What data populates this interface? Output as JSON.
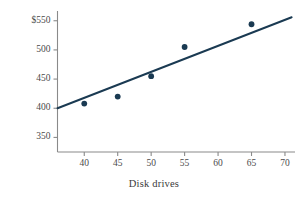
{
  "chart_data": {
    "type": "scatter",
    "title": "",
    "subtitle": "",
    "xlabel": "Disk drives",
    "ylabel": "Costs",
    "xlim": [
      36,
      71.5
    ],
    "ylim": [
      325,
      565
    ],
    "grid": false,
    "legend": null,
    "x_ticks": [
      40,
      45,
      50,
      55,
      60,
      65,
      70
    ],
    "x_tick_labels": [
      "40",
      "45",
      "50",
      "55",
      "60",
      "65",
      "70"
    ],
    "y_ticks": [
      350,
      400,
      450,
      500,
      550
    ],
    "y_tick_labels": [
      "350",
      "400",
      "450",
      "500",
      "$550"
    ],
    "series": [
      {
        "name": "observations",
        "type": "scatter",
        "marker": "filled-circle",
        "color": "#1a3a52",
        "points": [
          {
            "x": 40,
            "y": 408
          },
          {
            "x": 45,
            "y": 420
          },
          {
            "x": 50,
            "y": 455
          },
          {
            "x": 55,
            "y": 505
          },
          {
            "x": 65,
            "y": 544
          }
        ]
      },
      {
        "name": "regression-line",
        "type": "line",
        "color": "#1a3a52",
        "endpoints": [
          {
            "x": 36,
            "y": 400
          },
          {
            "x": 71,
            "y": 556
          }
        ]
      }
    ],
    "colors": {
      "marker": "#1a3a52",
      "line": "#1a3a52",
      "axis": "#8a8a8a",
      "text": "#3a3a3a",
      "background": "#ffffff"
    }
  }
}
